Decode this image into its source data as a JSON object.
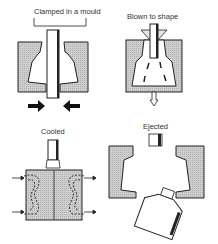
{
  "diagram": {
    "steps": [
      {
        "id": "clamped",
        "label": "Clamped in a mould"
      },
      {
        "id": "blown",
        "label": "Blown to shape"
      },
      {
        "id": "cooled",
        "label": "Cooled"
      },
      {
        "id": "ejected",
        "label": "Ejected"
      }
    ],
    "colors": {
      "mould_fill": "#c8c8c8",
      "outline": "#222222",
      "background": "#ffffff"
    }
  }
}
